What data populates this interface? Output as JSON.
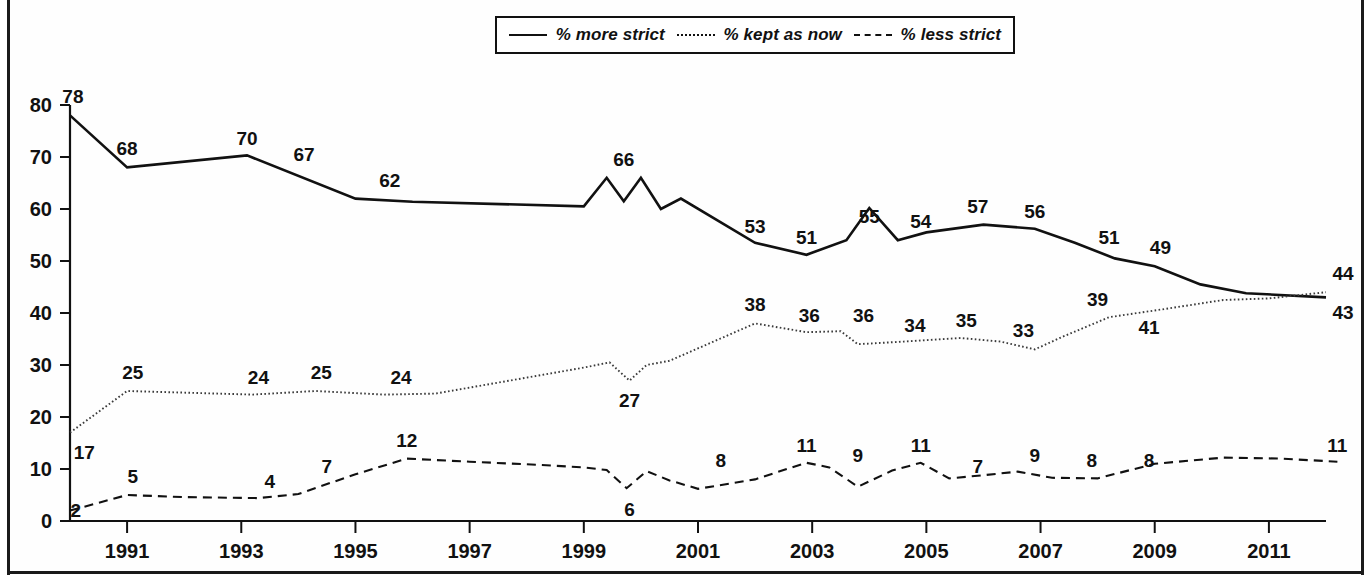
{
  "chart_data": {
    "type": "line",
    "title": "",
    "xlabel": "",
    "ylabel": "",
    "xlim": [
      1990,
      2012
    ],
    "ylim": [
      0,
      80
    ],
    "grid": false,
    "legend_position": "top-center",
    "x_ticks": [
      "1991",
      "1993",
      "1995",
      "1997",
      "1999",
      "2001",
      "2003",
      "2005",
      "2007",
      "2009",
      "2011"
    ],
    "x_tick_values": [
      1991,
      1993,
      1995,
      1997,
      1999,
      2001,
      2003,
      2005,
      2007,
      2009,
      2011
    ],
    "y_ticks": [
      "0",
      "10",
      "20",
      "30",
      "40",
      "50",
      "60",
      "70",
      "80"
    ],
    "y_tick_values": [
      0,
      10,
      20,
      30,
      40,
      50,
      60,
      70,
      80
    ],
    "series": [
      {
        "name": "% more strict",
        "style": "solid",
        "x": [
          1990.0,
          1991.0,
          1993.1,
          1995.0,
          1996.0,
          1999.0,
          1999.4,
          1999.7,
          2000.0,
          2000.35,
          2000.7,
          2002.0,
          2002.9,
          2003.6,
          2004.0,
          2004.5,
          2005.0,
          2006.0,
          2006.9,
          2007.6,
          2008.3,
          2009.0,
          2009.8,
          2010.6,
          2012.0
        ],
        "values": [
          78,
          68,
          70.3,
          62,
          61.4,
          60.5,
          66,
          61.5,
          66,
          60,
          62,
          53.5,
          51.2,
          54,
          60.2,
          54,
          55.5,
          57,
          56.2,
          53.5,
          50.5,
          49,
          45.5,
          43.8,
          43
        ],
        "labels": [
          {
            "text": "78",
            "x": 1990.05,
            "value": 78
          },
          {
            "text": "68",
            "x": 1991.0,
            "value": 68
          },
          {
            "text": "70",
            "x": 1993.1,
            "value": 70
          },
          {
            "text": "67",
            "x": 1994.1,
            "value": 67
          },
          {
            "text": "62",
            "x": 1995.6,
            "value": 62
          },
          {
            "text": "66",
            "x": 1999.7,
            "value": 66
          },
          {
            "text": "53",
            "x": 2002.0,
            "value": 53
          },
          {
            "text": "51",
            "x": 2002.9,
            "value": 51
          },
          {
            "text": "55",
            "x": 2004.0,
            "value": 55
          },
          {
            "text": "54",
            "x": 2004.9,
            "value": 54
          },
          {
            "text": "57",
            "x": 2005.9,
            "value": 57
          },
          {
            "text": "56",
            "x": 2006.9,
            "value": 56
          },
          {
            "text": "51",
            "x": 2008.2,
            "value": 51
          },
          {
            "text": "49",
            "x": 2009.1,
            "value": 49
          },
          {
            "text": "43",
            "x": 2012.3,
            "value": 43
          }
        ]
      },
      {
        "name": "% kept as now",
        "style": "dotted",
        "x": [
          1990.0,
          1991.0,
          1993.2,
          1994.3,
          1995.5,
          1996.4,
          1999.0,
          1999.45,
          1999.8,
          2000.1,
          2000.5,
          2002.0,
          2002.9,
          2003.5,
          2003.8,
          2004.6,
          2005.6,
          2006.3,
          2006.9,
          2007.4,
          2008.2,
          2009.2,
          2010.2,
          2011.0,
          2012.0
        ],
        "values": [
          17,
          25,
          24.3,
          25,
          24.3,
          24.5,
          29.5,
          30.5,
          27,
          30,
          30.8,
          38,
          36.3,
          36.5,
          34,
          34.5,
          35.2,
          34.5,
          33,
          35.5,
          39.2,
          40.8,
          42.5,
          42.8,
          44
        ],
        "labels": [
          {
            "text": "17",
            "x": 1990.25,
            "value": 17
          },
          {
            "text": "25",
            "x": 1991.1,
            "value": 25
          },
          {
            "text": "24",
            "x": 1993.3,
            "value": 24
          },
          {
            "text": "25",
            "x": 1994.4,
            "value": 25
          },
          {
            "text": "24",
            "x": 1995.8,
            "value": 24
          },
          {
            "text": "27",
            "x": 1999.8,
            "value": 27
          },
          {
            "text": "38",
            "x": 2002.0,
            "value": 38
          },
          {
            "text": "36",
            "x": 2002.95,
            "value": 36
          },
          {
            "text": "36",
            "x": 2003.9,
            "value": 36
          },
          {
            "text": "34",
            "x": 2004.8,
            "value": 34
          },
          {
            "text": "35",
            "x": 2005.7,
            "value": 35
          },
          {
            "text": "33",
            "x": 2006.7,
            "value": 33
          },
          {
            "text": "39",
            "x": 2008.0,
            "value": 39
          },
          {
            "text": "41",
            "x": 2008.9,
            "value": 41
          },
          {
            "text": "44",
            "x": 2012.3,
            "value": 44
          }
        ]
      },
      {
        "name": "% less strict",
        "style": "dashed",
        "x": [
          1990.0,
          1991.0,
          1992.0,
          1993.3,
          1994.0,
          1995.0,
          1995.9,
          1997.0,
          1998.2,
          1999.0,
          1999.4,
          1999.75,
          2000.1,
          2000.5,
          2001.0,
          2002.0,
          2002.5,
          2002.9,
          2003.3,
          2003.8,
          2004.4,
          2004.9,
          2005.4,
          2006.0,
          2006.6,
          2007.2,
          2008.0,
          2009.0,
          2010.2,
          2011.2,
          2012.2
        ],
        "values": [
          2,
          5,
          4.6,
          4.4,
          5.2,
          9,
          12,
          11.4,
          10.8,
          10.3,
          9.8,
          6.3,
          9.6,
          7.8,
          6.2,
          8,
          9.8,
          11.2,
          10.3,
          6.6,
          9.7,
          11.2,
          8.2,
          8.8,
          9.5,
          8.3,
          8.2,
          11,
          12.2,
          12,
          11.4
        ],
        "labels": [
          {
            "text": "2",
            "x": 1990.1,
            "value": 2
          },
          {
            "text": "5",
            "x": 1991.1,
            "value": 5
          },
          {
            "text": "4",
            "x": 1993.5,
            "value": 4
          },
          {
            "text": "7",
            "x": 1994.5,
            "value": 7
          },
          {
            "text": "12",
            "x": 1995.9,
            "value": 12
          },
          {
            "text": "6",
            "x": 1999.8,
            "value": 6
          },
          {
            "text": "8",
            "x": 2001.4,
            "value": 8
          },
          {
            "text": "11",
            "x": 2002.9,
            "value": 11
          },
          {
            "text": "9",
            "x": 2003.8,
            "value": 9
          },
          {
            "text": "11",
            "x": 2004.9,
            "value": 11
          },
          {
            "text": "7",
            "x": 2005.9,
            "value": 7
          },
          {
            "text": "9",
            "x": 2006.9,
            "value": 9
          },
          {
            "text": "8",
            "x": 2007.9,
            "value": 8
          },
          {
            "text": "8",
            "x": 2008.9,
            "value": 8
          },
          {
            "text": "11",
            "x": 2012.2,
            "value": 11
          }
        ]
      }
    ]
  },
  "legend": {
    "items": [
      {
        "label": "% more strict",
        "style": "solid"
      },
      {
        "label": "% kept as now",
        "style": "dotted"
      },
      {
        "label": "% less strict",
        "style": "dashed"
      }
    ]
  },
  "colors": {
    "line": "#111111",
    "background": "#ffffff",
    "frame": "#1a1a1a"
  }
}
